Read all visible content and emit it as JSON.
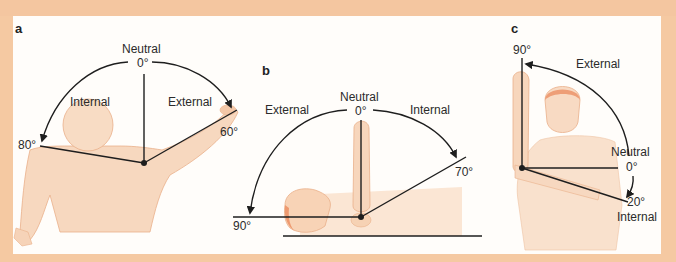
{
  "figure": {
    "colors": {
      "background": "#f5c9a2",
      "panel": "#fffdfa",
      "line": "#1e1e1e",
      "skin": "#f6d2b4",
      "skin_outline": "#e9a67a",
      "hair": "#e8936a"
    },
    "panels": [
      {
        "letter": "a",
        "neutral_label": "Neutral",
        "zero_label": "0°",
        "left_direction": "Internal",
        "right_direction": "External",
        "left_angle": "80°",
        "right_angle": "60°"
      },
      {
        "letter": "b",
        "neutral_label": "Neutral",
        "zero_label": "0°",
        "left_direction": "External",
        "right_direction": "Internal",
        "left_angle": "90°",
        "right_angle": "70°"
      },
      {
        "letter": "c",
        "top_angle": "90°",
        "external_label": "External",
        "neutral_label": "Neutral",
        "zero_label": "0°",
        "internal_angle": "20°",
        "internal_label": "Internal"
      }
    ]
  }
}
